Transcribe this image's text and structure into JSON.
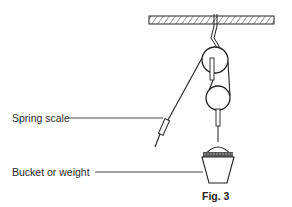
{
  "figure": {
    "caption": "Fig. 3",
    "labels": {
      "spring_scale": "Spring scale",
      "bucket_or_weight": "Bucket or weight"
    },
    "components": [
      "ceiling-support",
      "hook",
      "fixed-pulley",
      "movable-pulley",
      "string",
      "spring-scale",
      "bucket-with-weight"
    ],
    "colors": {
      "line": "#222222",
      "fill": "#ffffff"
    }
  }
}
